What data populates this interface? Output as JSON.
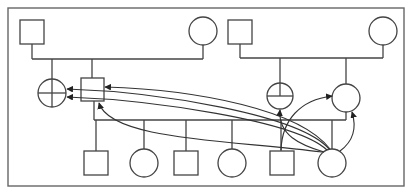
{
  "diagram": {
    "type": "pedigree-chart",
    "colors": {
      "stroke": "#444444",
      "background": "#ffffff",
      "frame": "#666666"
    },
    "frame": {
      "x": 8,
      "y": 8,
      "width": 396,
      "height": 178
    },
    "generations": [
      {
        "level": 1,
        "couples": [
          {
            "id": "couple-left",
            "members": [
              "male-g1-left",
              "female-g1-left"
            ]
          },
          {
            "id": "couple-right",
            "members": [
              "male-g1-right",
              "female-g1-right"
            ]
          }
        ]
      }
    ],
    "nodes": [
      {
        "id": "male-g1-left",
        "shape": "square",
        "x": 20,
        "y": 20,
        "size": 24
      },
      {
        "id": "female-g1-left",
        "shape": "circle",
        "cx": 203,
        "cy": 31,
        "r": 14
      },
      {
        "id": "male-g1-right",
        "shape": "square",
        "x": 227,
        "y": 20,
        "size": 24
      },
      {
        "id": "female-g1-right",
        "shape": "circle",
        "cx": 383,
        "cy": 31,
        "r": 14
      },
      {
        "id": "crossed-circle-left",
        "shape": "crossed-circle",
        "cx": 52,
        "cy": 93,
        "r": 14
      },
      {
        "id": "male-g2",
        "shape": "square",
        "x": 81,
        "y": 78,
        "size": 23
      },
      {
        "id": "crossed-circle-right",
        "shape": "crossed-circle",
        "cx": 280,
        "cy": 96,
        "r": 13
      },
      {
        "id": "female-g2",
        "shape": "circle",
        "cx": 346,
        "cy": 98,
        "r": 14
      },
      {
        "id": "child-1-male",
        "shape": "square",
        "x": 84,
        "y": 151,
        "size": 24
      },
      {
        "id": "child-2-female",
        "shape": "circle",
        "cx": 144,
        "cy": 163,
        "r": 14
      },
      {
        "id": "child-3-male",
        "shape": "square",
        "x": 174,
        "y": 151,
        "size": 24
      },
      {
        "id": "child-4-female",
        "shape": "circle",
        "cx": 232,
        "cy": 163,
        "r": 14
      },
      {
        "id": "child-5-male",
        "shape": "square",
        "x": 270,
        "y": 151,
        "size": 24
      },
      {
        "id": "child-6-female",
        "shape": "circle",
        "cx": 332,
        "cy": 163,
        "r": 14
      }
    ],
    "arrows": [
      {
        "from": "child-6-female",
        "to": "male-g2",
        "target_side": "right"
      },
      {
        "from": "child-6-female",
        "to": "crossed-circle-left",
        "target_side": "right-upper"
      },
      {
        "from": "child-6-female",
        "to": "crossed-circle-left",
        "target_side": "right-lower"
      },
      {
        "from": "child-6-female",
        "to": "male-g2",
        "target_side": "bottom"
      },
      {
        "from": "child-6-female",
        "to": "crossed-circle-right",
        "target_side": "bottom"
      },
      {
        "from": "child-6-female",
        "to": "female-g2",
        "target_side": "bottom"
      },
      {
        "from": "child-5-male",
        "to": "female-g2",
        "target_side": "left"
      }
    ],
    "labels": []
  }
}
